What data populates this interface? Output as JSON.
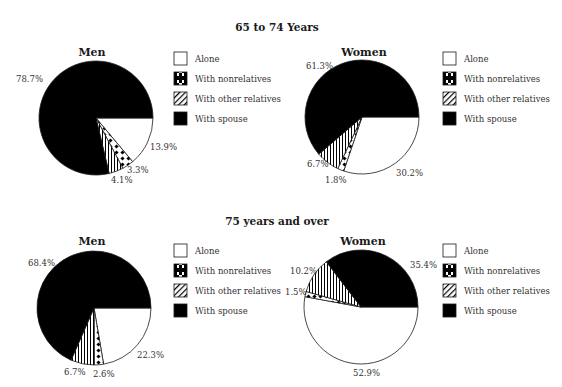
{
  "colors": {
    "alone": "#ffffff",
    "nonrelatives_pattern": "#000000",
    "other_relatives_pattern": "#000000",
    "spouse": "#000000",
    "outline": "#1a1a1a"
  },
  "legend": {
    "items": [
      {
        "label": "Alone",
        "icon": "white-box-icon"
      },
      {
        "label": "With nonrelatives",
        "icon": "dotted-box-icon"
      },
      {
        "label": "With other relatives",
        "icon": "hatched-box-icon"
      },
      {
        "label": "With spouse",
        "icon": "black-box-icon"
      }
    ]
  },
  "sections": [
    {
      "title": "65 to 74 Years"
    },
    {
      "title": "75 years and over"
    }
  ],
  "pies": [
    {
      "title": "Men",
      "labels": [
        "13.9%",
        "3.3%",
        "4.1%",
        "78.7%"
      ]
    },
    {
      "title": "Women",
      "labels": [
        "30.2%",
        "1.8%",
        "6.7%",
        "61.3%"
      ]
    },
    {
      "title": "Men",
      "labels": [
        "22.3%",
        "2.6%",
        "6.7%",
        "68.4%"
      ]
    },
    {
      "title": "Women",
      "labels": [
        "52.9%",
        "1.5%",
        "10.2%",
        "35.4%"
      ]
    }
  ],
  "chart_data": [
    {
      "type": "pie",
      "title": "65 to 74 Years — Men",
      "categories": [
        "Alone",
        "With nonrelatives",
        "With other relatives",
        "With spouse"
      ],
      "values": [
        13.9,
        3.3,
        4.1,
        78.7
      ],
      "legend_position": "right"
    },
    {
      "type": "pie",
      "title": "65 to 74 Years — Women",
      "categories": [
        "Alone",
        "With nonrelatives",
        "With other relatives",
        "With spouse"
      ],
      "values": [
        30.2,
        1.8,
        6.7,
        61.3
      ],
      "legend_position": "right"
    },
    {
      "type": "pie",
      "title": "75 years and over — Men",
      "categories": [
        "Alone",
        "With nonrelatives",
        "With other relatives",
        "With spouse"
      ],
      "values": [
        22.3,
        2.6,
        6.7,
        68.4
      ],
      "legend_position": "right"
    },
    {
      "type": "pie",
      "title": "75 years and over — Women",
      "categories": [
        "Alone",
        "With nonrelatives",
        "With other relatives",
        "With spouse"
      ],
      "values": [
        52.9,
        1.5,
        10.2,
        35.4
      ],
      "legend_position": "right"
    }
  ]
}
